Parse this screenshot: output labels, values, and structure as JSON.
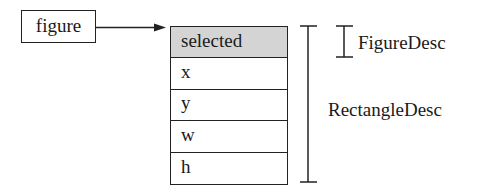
{
  "diagram": {
    "source_box": {
      "label": "figure"
    },
    "arrow": {
      "from": "figure",
      "to": "record-table"
    },
    "record": {
      "fields": [
        {
          "label": "selected",
          "shaded": true
        },
        {
          "label": "x",
          "shaded": false
        },
        {
          "label": "y",
          "shaded": false
        },
        {
          "label": "w",
          "shaded": false
        },
        {
          "label": "h",
          "shaded": false
        }
      ],
      "shade_color": "#d4d4d4"
    },
    "brackets": {
      "figure_desc": {
        "label": "FigureDesc",
        "spans_fields": [
          "selected"
        ]
      },
      "rectangle_desc": {
        "label": "RectangleDesc",
        "spans_fields": [
          "selected",
          "x",
          "y",
          "w",
          "h"
        ]
      }
    }
  }
}
